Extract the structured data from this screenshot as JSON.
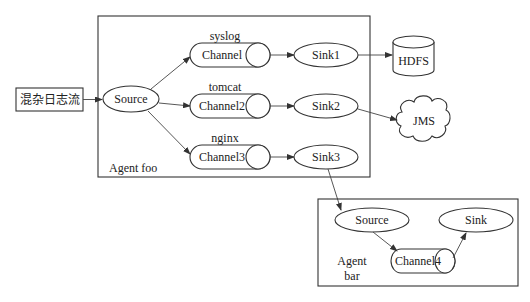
{
  "input": {
    "label": "混杂日志流"
  },
  "agent_foo": {
    "label": "Agent foo",
    "source": "Source",
    "channels": [
      {
        "label": "Channel",
        "type": "syslog"
      },
      {
        "label": "Channel2",
        "type": "tomcat"
      },
      {
        "label": "Channel3",
        "type": "nginx"
      }
    ],
    "sinks": [
      "Sink1",
      "Sink2",
      "Sink3"
    ]
  },
  "destinations": {
    "hdfs": "HDFS",
    "jms": "JMS"
  },
  "agent_bar": {
    "label_line1": "Agent",
    "label_line2": "bar",
    "source": "Source",
    "channel": "Channel4",
    "sink": "Sink"
  },
  "edges": [
    [
      "混杂日志流",
      "Source"
    ],
    [
      "Source",
      "Channel"
    ],
    [
      "Source",
      "Channel2"
    ],
    [
      "Source",
      "Channel3"
    ],
    [
      "Channel",
      "Sink1"
    ],
    [
      "Channel2",
      "Sink2"
    ],
    [
      "Channel3",
      "Sink3"
    ],
    [
      "Sink1",
      "HDFS"
    ],
    [
      "Sink2",
      "JMS"
    ],
    [
      "Sink3",
      "Agent bar Source"
    ],
    [
      "Agent bar Source",
      "Channel4"
    ],
    [
      "Channel4",
      "Agent bar Sink"
    ]
  ]
}
